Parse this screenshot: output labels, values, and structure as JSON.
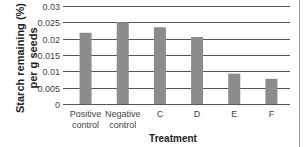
{
  "chart_data": {
    "type": "bar",
    "title": "",
    "xlabel": "Treatment",
    "ylabel": "Starch remaining (%) per g seeds",
    "ylabel_lines": [
      "Starch remaining (%)",
      "per g seeds"
    ],
    "categories": [
      "Positive control",
      "Negative control",
      "C",
      "D",
      "E",
      "F"
    ],
    "category_lines": [
      [
        "Positive",
        "control"
      ],
      [
        "Negative",
        "control"
      ],
      [
        "C"
      ],
      [
        "D"
      ],
      [
        "E"
      ],
      [
        "F"
      ]
    ],
    "values": [
      0.0218,
      0.025,
      0.0235,
      0.0205,
      0.0093,
      0.0077
    ],
    "ylim": [
      0,
      0.03
    ],
    "yticks": [
      0,
      0.005,
      0.01,
      0.015,
      0.02,
      0.025,
      0.03
    ],
    "ytick_labels": [
      "0",
      "0.005",
      "0.01",
      "0.015",
      "0.02",
      "0.025",
      "0.03"
    ],
    "grid": true,
    "legend": null,
    "colors": {
      "bar": "#8c8c8c",
      "grid": "#555555",
      "border": "#999999"
    }
  }
}
